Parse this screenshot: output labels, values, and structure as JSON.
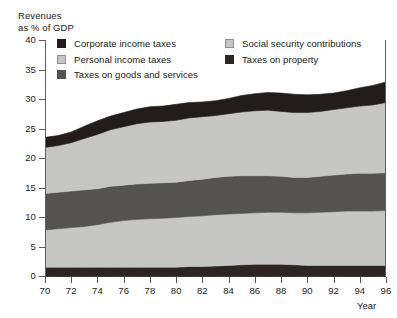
{
  "figure": {
    "name": "tax-revenue-composition-chart",
    "y_axis_title": "Revenues\nas % of GDP",
    "x_axis_title": "Year"
  },
  "legend": {
    "left_column": [
      {
        "label": "Corporate income taxes",
        "swatch": "sw-corporate",
        "color": "#241c1a"
      },
      {
        "label": "Personal income taxes",
        "swatch": "sw-personal",
        "color": "#c6c6c4"
      },
      {
        "label": "Taxes on goods and services",
        "swatch": "sw-goods",
        "color": "#55534f"
      }
    ],
    "right_column": [
      {
        "label": "Social security contributions",
        "swatch": "sw-social",
        "color": "#c6c6c4"
      },
      {
        "label": "Taxes on property",
        "swatch": "sw-property",
        "color": "#2e2522"
      }
    ]
  },
  "chart_data": {
    "type": "area",
    "stacked": true,
    "title": "",
    "subtitle": "",
    "xlabel": "Year",
    "ylabel": "Revenues as % of GDP",
    "xlim": [
      70,
      96
    ],
    "ylim": [
      0,
      40
    ],
    "grid": false,
    "legend_position": "top",
    "x": [
      70,
      71,
      72,
      73,
      74,
      75,
      76,
      77,
      78,
      79,
      80,
      81,
      82,
      83,
      84,
      85,
      86,
      87,
      88,
      89,
      90,
      91,
      92,
      93,
      94,
      95,
      96
    ],
    "xticks": [
      70,
      72,
      74,
      76,
      78,
      80,
      82,
      84,
      86,
      88,
      90,
      92,
      94,
      96
    ],
    "xticklabels": [
      "70",
      "72",
      "74",
      "76",
      "78",
      "80",
      "82",
      "84",
      "86",
      "88",
      "90",
      "92",
      "94",
      "96"
    ],
    "yticks": [
      0,
      5,
      10,
      15,
      20,
      25,
      30,
      35,
      40
    ],
    "yticklabels": [
      "0",
      "5",
      "10",
      "15",
      "20",
      "25",
      "30",
      "35",
      "40"
    ],
    "series": [
      {
        "name": "Taxes on property",
        "color": "#2e2522",
        "stack_order": 1,
        "values": [
          1.5,
          1.5,
          1.5,
          1.5,
          1.5,
          1.5,
          1.5,
          1.5,
          1.5,
          1.5,
          1.5,
          1.6,
          1.6,
          1.7,
          1.8,
          1.9,
          2.0,
          2.0,
          2.0,
          1.9,
          1.8,
          1.8,
          1.8,
          1.8,
          1.8,
          1.8,
          1.8
        ]
      },
      {
        "name": "Social security contributions",
        "color": "#c6c6c4",
        "stack_order": 2,
        "values": [
          6.3,
          6.5,
          6.7,
          6.9,
          7.2,
          7.6,
          7.9,
          8.1,
          8.2,
          8.3,
          8.4,
          8.5,
          8.6,
          8.7,
          8.7,
          8.7,
          8.7,
          8.8,
          8.8,
          8.8,
          8.9,
          9.0,
          9.1,
          9.2,
          9.2,
          9.2,
          9.3
        ]
      },
      {
        "name": "Taxes on goods and services",
        "color": "#55534f",
        "stack_order": 3,
        "values": [
          6.2,
          6.2,
          6.2,
          6.2,
          6.1,
          6.1,
          6.0,
          6.0,
          6.0,
          6.0,
          6.0,
          6.1,
          6.2,
          6.3,
          6.4,
          6.4,
          6.3,
          6.2,
          6.1,
          6.0,
          6.0,
          6.1,
          6.2,
          6.3,
          6.4,
          6.4,
          6.4
        ]
      },
      {
        "name": "Personal income taxes",
        "color": "#c6c6c4",
        "stack_order": 4,
        "values": [
          7.8,
          7.9,
          8.2,
          8.7,
          9.2,
          9.6,
          9.9,
          10.2,
          10.4,
          10.4,
          10.5,
          10.6,
          10.6,
          10.5,
          10.6,
          10.8,
          11.0,
          11.1,
          11.0,
          11.0,
          11.0,
          11.0,
          11.1,
          11.2,
          11.4,
          11.6,
          11.9
        ]
      },
      {
        "name": "Corporate income taxes",
        "color": "#241c1a",
        "stack_order": 5,
        "values": [
          1.7,
          1.7,
          1.8,
          2.1,
          2.3,
          2.3,
          2.4,
          2.5,
          2.6,
          2.6,
          2.7,
          2.6,
          2.5,
          2.5,
          2.6,
          2.8,
          2.9,
          3.0,
          3.1,
          3.1,
          3.0,
          2.9,
          2.8,
          2.9,
          3.1,
          3.3,
          3.5
        ]
      }
    ],
    "totals": [
      23.5,
      23.8,
      24.4,
      25.4,
      26.3,
      27.1,
      27.7,
      28.3,
      28.7,
      28.8,
      29.1,
      29.4,
      29.5,
      29.7,
      30.1,
      30.6,
      30.9,
      31.1,
      31.0,
      30.8,
      30.7,
      30.8,
      31.0,
      31.4,
      31.9,
      32.3,
      32.9
    ]
  }
}
